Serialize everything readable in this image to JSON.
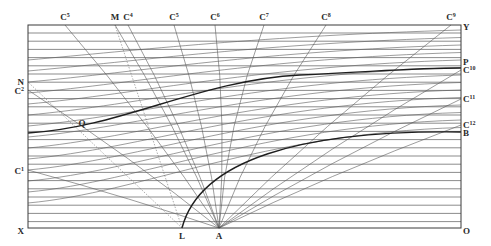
{
  "diagram": {
    "frame": {
      "left": 28,
      "top": 25,
      "right": 461,
      "bottom": 228
    },
    "colors": {
      "line": "#5a5a5a",
      "bold": "#1e1e1e",
      "background": "#ffffff"
    },
    "top_labels": [
      {
        "id": "C5",
        "base": "C",
        "sup": "5",
        "x": 65
      },
      {
        "id": "M",
        "base": "M",
        "sup": "",
        "x": 115
      },
      {
        "id": "C4",
        "base": "C",
        "sup": "4",
        "x": 128
      },
      {
        "id": "C5b",
        "base": "C",
        "sup": "5",
        "x": 174
      },
      {
        "id": "C6",
        "base": "C",
        "sup": "6",
        "x": 215
      },
      {
        "id": "C7",
        "base": "C",
        "sup": "7",
        "x": 264
      },
      {
        "id": "C8",
        "base": "C",
        "sup": "8",
        "x": 326
      },
      {
        "id": "C9",
        "base": "C",
        "sup": "9",
        "x": 451
      }
    ],
    "left_labels": [
      {
        "id": "N",
        "base": "N",
        "sup": "",
        "y": 82
      },
      {
        "id": "C2",
        "base": "C",
        "sup": "2",
        "y": 91
      },
      {
        "id": "C1",
        "base": "C",
        "sup": "1",
        "y": 171
      },
      {
        "id": "X",
        "base": "X",
        "sup": "",
        "y": 231
      }
    ],
    "right_labels": [
      {
        "id": "Y",
        "base": "Y",
        "sup": "",
        "y": 27
      },
      {
        "id": "P",
        "base": "P",
        "sup": "",
        "y": 62
      },
      {
        "id": "C10",
        "base": "C",
        "sup": "10",
        "y": 70
      },
      {
        "id": "C11",
        "base": "C",
        "sup": "11",
        "y": 99
      },
      {
        "id": "C12",
        "base": "C",
        "sup": "12",
        "y": 125
      },
      {
        "id": "B",
        "base": "B",
        "sup": "",
        "y": 133
      },
      {
        "id": "O",
        "base": "O",
        "sup": "",
        "y": 231
      }
    ],
    "bottom_labels": [
      {
        "id": "L",
        "base": "L",
        "x": 182
      },
      {
        "id": "A",
        "base": "A",
        "x": 219
      }
    ],
    "inner_labels": [
      {
        "id": "Q",
        "base": "Q",
        "x": 82,
        "y": 126
      }
    ],
    "focus_point": {
      "label": "A",
      "x": 219,
      "y": 228
    },
    "secondary_point": {
      "label": "L",
      "x": 182,
      "y": 228
    }
  }
}
